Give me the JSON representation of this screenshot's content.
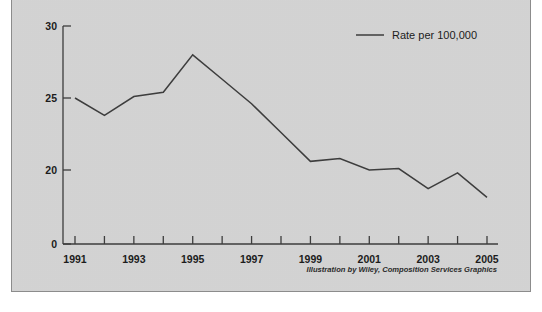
{
  "figure": {
    "panel_background": "#d4d4d4",
    "panel_border_color": "#8c8c8c",
    "clipped_caption": "",
    "credit": "Illustration by Wiley, Composition Services Graphics"
  },
  "legend": {
    "entries": [
      {
        "label": "Rate per 100,000",
        "color": "#3d3d3d",
        "marker": "line"
      }
    ],
    "position": "top-right"
  },
  "chart_data": {
    "type": "line",
    "title": "",
    "subtitle": "",
    "xlabel": "",
    "ylabel": "",
    "x": [
      1991,
      1992,
      1993,
      1994,
      1995,
      1996,
      1997,
      1998,
      1999,
      2000,
      2001,
      2002,
      2003,
      2004,
      2005
    ],
    "xtick_labels": [
      "1991",
      "",
      "1993",
      "",
      "1995",
      "",
      "1997",
      "",
      "1999",
      "",
      "2001",
      "",
      "2003",
      "",
      "2005"
    ],
    "xtick_values": [
      1991,
      1992,
      1993,
      1994,
      1995,
      1996,
      1997,
      1998,
      1999,
      2000,
      2001,
      2002,
      2003,
      2004,
      2005
    ],
    "ytick_labels": [
      "0",
      "20",
      "25",
      "30"
    ],
    "ytick_values": [
      0,
      20,
      25,
      30
    ],
    "ylim": [
      0,
      30
    ],
    "xlim": [
      1990.6,
      2005.4
    ],
    "grid": false,
    "axis_break": true,
    "series": [
      {
        "name": "Rate per 100,000",
        "color": "#3d3d3d",
        "values": [
          25.0,
          23.8,
          25.1,
          25.4,
          28.0,
          26.3,
          24.6,
          22.6,
          20.6,
          20.8,
          20.0,
          20.1,
          18.7,
          19.8,
          18.1
        ]
      }
    ]
  }
}
